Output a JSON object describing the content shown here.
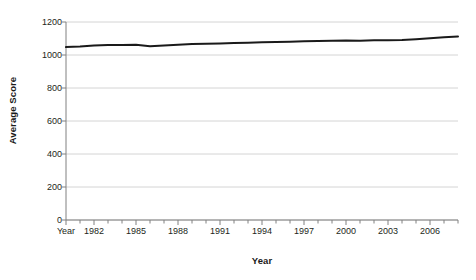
{
  "chart_data": {
    "type": "line",
    "title": "",
    "xlabel": "Year",
    "ylabel": "Average Score",
    "ylim": [
      0,
      1200
    ],
    "yticks": [
      0,
      200,
      400,
      600,
      800,
      1000,
      1200
    ],
    "ytick_labels": [
      "0",
      "200",
      "400",
      "600",
      "800",
      "1000",
      "1200"
    ],
    "xlim": [
      1980,
      2008
    ],
    "xtick_labels": [
      "Year",
      "1982",
      "1985",
      "1988",
      "1991",
      "1994",
      "1997",
      "2000",
      "2003",
      "2006"
    ],
    "xtick_values": [
      1980,
      1982,
      1985,
      1988,
      1991,
      1994,
      1997,
      2000,
      2003,
      2006
    ],
    "minor_xticks_every": 1,
    "grid": "horizontal",
    "legend": "none",
    "line_color": "#1a1a1a",
    "line_width": 2,
    "gridline_color": "#d4d4d4",
    "axis_color": "#808080",
    "background_color": "#ffffff",
    "x": [
      1980,
      1981,
      1982,
      1983,
      1984,
      1985,
      1986,
      1987,
      1988,
      1989,
      1990,
      1991,
      1992,
      1993,
      1994,
      1995,
      1996,
      1997,
      1998,
      1999,
      2000,
      2001,
      2002,
      2003,
      2004,
      2005,
      2006,
      2007,
      2008
    ],
    "series": [
      {
        "name": "Average Score",
        "values": [
          1048,
          1052,
          1058,
          1060,
          1061,
          1062,
          1053,
          1057,
          1062,
          1066,
          1068,
          1070,
          1073,
          1075,
          1077,
          1079,
          1081,
          1083,
          1085,
          1086,
          1088,
          1087,
          1089,
          1090,
          1091,
          1096,
          1102,
          1107,
          1112
        ]
      }
    ]
  }
}
